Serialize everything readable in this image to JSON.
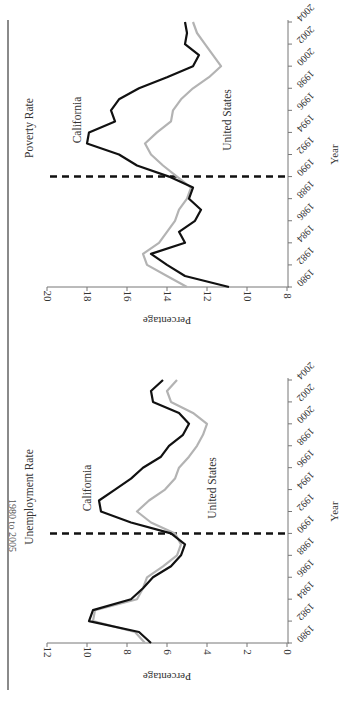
{
  "page": {
    "title_fragment": "1980 to 2005"
  },
  "chart_data": [
    {
      "type": "line",
      "title": "Poverty Rate",
      "xlabel": "Year",
      "ylabel": "Percentage",
      "ylim": [
        8,
        20
      ],
      "yticks": [
        8,
        10,
        12,
        14,
        16,
        18,
        20
      ],
      "xticks": [
        1980,
        1982,
        1984,
        1986,
        1988,
        1990,
        1992,
        1994,
        1996,
        1998,
        2000,
        2002,
        2004
      ],
      "x": [
        1980,
        1981,
        1982,
        1983,
        1984,
        1985,
        1986,
        1987,
        1988,
        1989,
        1990,
        1991,
        1992,
        1993,
        1994,
        1995,
        1996,
        1997,
        1998,
        1999,
        2000,
        2001,
        2002,
        2003,
        2004
      ],
      "series": [
        {
          "name": "California",
          "color": "#111111",
          "label_pos": "near 1992 peak",
          "values": [
            10.9,
            13.1,
            14.0,
            14.8,
            13.1,
            13.4,
            12.6,
            12.3,
            12.9,
            12.7,
            13.9,
            15.5,
            16.4,
            18.0,
            17.9,
            16.6,
            16.8,
            16.4,
            15.4,
            14.0,
            12.7,
            12.4,
            13.1,
            13.0,
            13.1
          ]
        },
        {
          "name": "United States",
          "color": "#b3b3b3",
          "values": [
            13.0,
            14.0,
            15.0,
            15.2,
            14.4,
            14.0,
            13.6,
            13.4,
            13.0,
            12.8,
            13.5,
            14.2,
            14.8,
            15.1,
            14.5,
            13.8,
            13.7,
            13.3,
            12.7,
            11.9,
            11.3,
            11.7,
            12.1,
            12.5,
            12.7
          ]
        }
      ],
      "annotations": [
        {
          "type": "vertical-dashed-line",
          "x": 1990
        }
      ],
      "grid": false,
      "orientation": "rotated 90deg (page rotated)"
    },
    {
      "type": "line",
      "title": "Unemployment Rate",
      "xlabel": "Year",
      "ylabel": "Percentage",
      "ylim": [
        0,
        12
      ],
      "yticks": [
        0,
        2,
        4,
        6,
        8,
        10,
        12
      ],
      "xticks": [
        1980,
        1982,
        1984,
        1986,
        1988,
        1990,
        1992,
        1994,
        1996,
        1998,
        2000,
        2002,
        2004
      ],
      "x": [
        1980,
        1981,
        1982,
        1983,
        1984,
        1985,
        1986,
        1987,
        1988,
        1989,
        1990,
        1991,
        1992,
        1993,
        1994,
        1995,
        1996,
        1997,
        1998,
        1999,
        2000,
        2001,
        2002,
        2003,
        2004
      ],
      "series": [
        {
          "name": "California",
          "color": "#111111",
          "values": [
            6.8,
            7.4,
            9.9,
            9.7,
            7.8,
            7.2,
            6.7,
            5.8,
            5.3,
            5.1,
            5.8,
            7.8,
            9.3,
            9.4,
            8.6,
            7.8,
            7.2,
            6.3,
            5.9,
            5.2,
            4.9,
            5.4,
            6.7,
            6.8,
            6.2
          ]
        },
        {
          "name": "United States",
          "color": "#b3b3b3",
          "values": [
            7.1,
            7.6,
            9.7,
            9.6,
            7.5,
            7.2,
            7.0,
            6.2,
            5.5,
            5.3,
            5.6,
            6.8,
            7.5,
            6.9,
            6.1,
            5.6,
            5.4,
            4.9,
            4.5,
            4.2,
            4.0,
            4.7,
            5.8,
            6.0,
            5.5
          ]
        }
      ],
      "annotations": [
        {
          "type": "vertical-dashed-line",
          "x": 1990
        }
      ],
      "grid": false,
      "orientation": "rotated 90deg (page rotated)"
    }
  ],
  "labels": {
    "poverty": {
      "title": "Poverty Rate",
      "ca": "California",
      "us": "United States",
      "xlabel": "Year",
      "ylabel": "Percentage"
    },
    "unemp": {
      "title": "Unemployment Rate",
      "ca": "California",
      "us": "United States",
      "xlabel": "Year",
      "ylabel": "Percentage"
    }
  }
}
